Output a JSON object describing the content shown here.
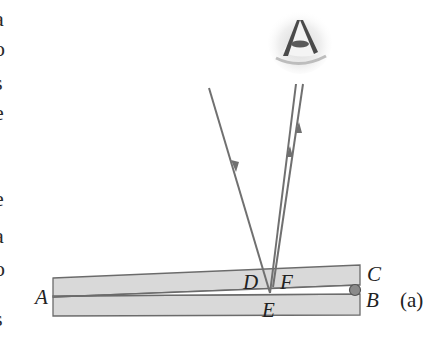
{
  "figure": {
    "caption": "(a)",
    "labels": {
      "A": "A",
      "B": "B",
      "C": "C",
      "D": "D",
      "E": "E",
      "F": "F"
    },
    "clipped_text_left_edge": [
      "a",
      "o",
      "s",
      "e",
      "e",
      "a",
      "o",
      ",",
      "s"
    ],
    "elements": {
      "upper_plate": "glass plate (top, tilted)",
      "lower_plate": "glass plate (bottom)",
      "air_wedge": "thin air wedge between plates from A to B",
      "spacer": "small spacer (wire/ball) at B",
      "incident_ray": "incident light ray with downward arrow",
      "reflected_rays": "two reflected rays with upward arrows toward eye",
      "eye": "observer eye icon"
    },
    "colors": {
      "plate_fill": "#d9d9d9",
      "plate_stroke": "#6b6b6b",
      "ray": "#707070",
      "spacer_fill": "#8a8a8a",
      "text": "#222222"
    }
  }
}
